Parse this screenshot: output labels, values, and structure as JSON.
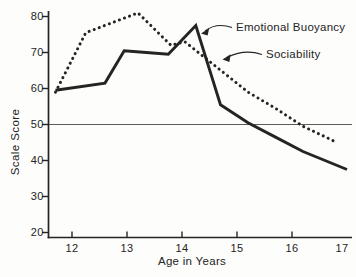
{
  "figure": {
    "background": "#fdfdfc",
    "ink": "#242424"
  },
  "chart_data": {
    "type": "line",
    "title": "",
    "xlabel": "Age in Years",
    "ylabel": "Scale Score",
    "xlim": [
      11.55,
      17.25
    ],
    "ylim": [
      20,
      81.5
    ],
    "x_ticks": [
      12,
      13,
      14,
      15,
      16,
      17
    ],
    "y_ticks": [
      20,
      30,
      40,
      50,
      60,
      70,
      80
    ],
    "grid": false,
    "reference_line": {
      "y": 50
    },
    "legend_position": "inline annotations with arrows",
    "series": [
      {
        "name": "Emotional Buoyancy",
        "line_style": "solid",
        "color": "#242424",
        "points": [
          [
            11.7,
            59.5
          ],
          [
            12.6,
            61.5
          ],
          [
            12.95,
            70.5
          ],
          [
            13.35,
            70.0
          ],
          [
            13.75,
            69.5
          ],
          [
            14.25,
            77.5
          ],
          [
            14.7,
            55.5
          ],
          [
            15.2,
            50.5
          ],
          [
            15.7,
            46.5
          ],
          [
            16.2,
            42.5
          ],
          [
            16.6,
            40.0
          ],
          [
            17.0,
            37.5
          ]
        ]
      },
      {
        "name": "Sociability",
        "line_style": "dotted",
        "color": "#242424",
        "points": [
          [
            11.7,
            59.0
          ],
          [
            12.25,
            75.5
          ],
          [
            13.2,
            81.0
          ],
          [
            13.8,
            72.0
          ],
          [
            14.05,
            73.0
          ],
          [
            15.2,
            59.0
          ],
          [
            15.7,
            54.5
          ],
          [
            16.2,
            49.5
          ],
          [
            16.75,
            45.5
          ]
        ]
      }
    ]
  }
}
